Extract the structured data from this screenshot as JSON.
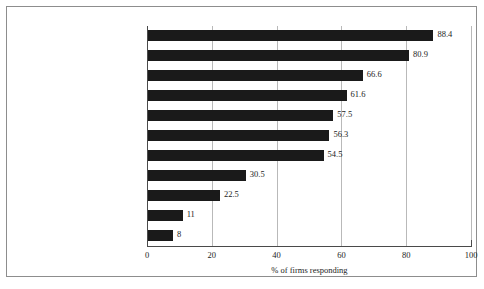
{
  "chart_data": {
    "type": "bar",
    "orientation": "horizontal",
    "title": "",
    "xlabel": "% of firms responding",
    "ylabel": "",
    "xlim": [
      0,
      100
    ],
    "xticks": [
      0,
      20,
      40,
      60,
      80,
      100
    ],
    "grid": true,
    "legend": null,
    "bar_color": "#1a1a1a",
    "categories": [
      "Discipline, work ethic",
      "Reliability, minimum supervision",
      "Willing to stay at the job",
      "Adaptability, willing to change",
      "Good basic education",
      "Good communication skills",
      "Teamwork",
      "Technical or computer skills",
      "Innovative ideas",
      "Degree or diploma",
      "Other"
    ],
    "values": [
      88.4,
      80.9,
      66.6,
      61.6,
      57.5,
      56.3,
      54.5,
      30.5,
      22.5,
      11,
      8
    ],
    "value_labels": [
      "88.4",
      "80.9",
      "66.6",
      "61.6",
      "57.5",
      "56.3",
      "54.5",
      "30.5",
      "22.5",
      "11",
      "8"
    ]
  }
}
